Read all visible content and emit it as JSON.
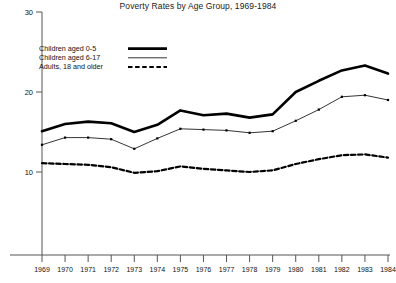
{
  "chart_data": {
    "type": "line",
    "title": "Poverty Rates by Age Group, 1969-1984",
    "xlabel": "",
    "ylabel": "",
    "ylim": [
      0,
      30
    ],
    "yticks": [
      10,
      20,
      30
    ],
    "xlim": [
      1969,
      1984
    ],
    "grid": false,
    "legend_position": "upper-left inside plot",
    "categories": [
      1969,
      1970,
      1971,
      1972,
      1973,
      1974,
      1975,
      1976,
      1977,
      1978,
      1979,
      1980,
      1981,
      1982,
      1983,
      1984
    ],
    "xticklabels": [
      "1969",
      "1970",
      "1971",
      "1972",
      "1973",
      "1974",
      "1975",
      "1976",
      "1977",
      "1978",
      "1979",
      "1980",
      "1981",
      "1982",
      "1983",
      "1984"
    ],
    "series": [
      {
        "name": "Children aged 0-5",
        "style": "thick-solid",
        "color": "#000000",
        "values": [
          15.1,
          16.0,
          16.3,
          16.1,
          15.0,
          15.9,
          17.7,
          17.1,
          17.3,
          16.8,
          17.2,
          20.0,
          21.4,
          22.7,
          23.3,
          22.3
        ]
      },
      {
        "name": "Children aged 6-17",
        "style": "thin-solid-markers",
        "color": "#000000",
        "values": [
          13.4,
          14.3,
          14.3,
          14.1,
          12.9,
          14.2,
          15.4,
          15.3,
          15.2,
          14.9,
          15.1,
          16.4,
          17.8,
          19.4,
          19.6,
          19.0
        ]
      },
      {
        "name": "Adults, 18 and older",
        "style": "thick-dashed",
        "color": "#000000",
        "values": [
          11.1,
          11.0,
          10.9,
          10.6,
          9.9,
          10.1,
          10.7,
          10.4,
          10.2,
          10.0,
          10.2,
          11.0,
          11.6,
          12.1,
          12.2,
          11.8
        ]
      }
    ]
  },
  "axis": {
    "ytick_labels": [
      "30",
      "20",
      "10"
    ],
    "ytick_values": [
      30,
      20,
      10
    ]
  },
  "legend": {
    "items": [
      {
        "label": "Children aged 0-5",
        "style": "thick-solid"
      },
      {
        "label": "Children aged 6-17",
        "style": "thin-solid"
      },
      {
        "label": "Adults, 18 and older",
        "style": "thick-dashed"
      }
    ]
  }
}
